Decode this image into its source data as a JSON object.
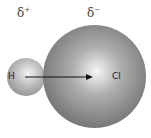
{
  "labels": {
    "h_charge": {
      "symbol": "δ",
      "sign": "+"
    },
    "cl_charge": {
      "symbol": "δ",
      "sign": "−"
    }
  },
  "atoms": {
    "h": "H",
    "cl": "Cl"
  },
  "colors": {
    "sphere_dark": "#6e6e6e",
    "sphere_light": "#f2f2f2",
    "arrow": "#111111"
  }
}
